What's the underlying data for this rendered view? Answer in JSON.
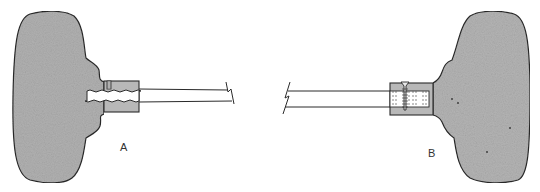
{
  "figure": {
    "type": "technical-diagram",
    "labels": {
      "a": "A",
      "b": "B"
    },
    "parts": {
      "a": {
        "description": "handle with threaded socket and set screw",
        "joint": "threaded"
      },
      "b": {
        "description": "handle with socket and cross pin screw",
        "joint": "pinned"
      }
    },
    "colors": {
      "handle_fill": "#b4b4b4",
      "outline": "#2a2a2a",
      "background": "#ffffff"
    }
  }
}
